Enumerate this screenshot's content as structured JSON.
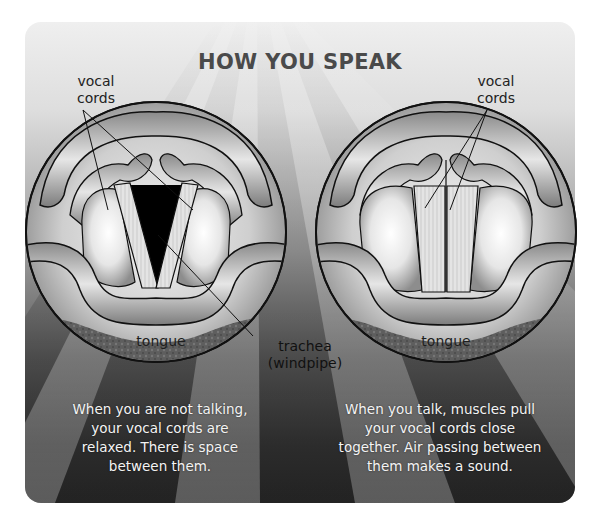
{
  "title": "HOW YOU SPEAK",
  "colors": {
    "panel_top": "#efefef",
    "panel_bottom": "#2e2e2e",
    "title": "#4a4a4a",
    "caption": "#f4f4f4",
    "opening": "#000000"
  },
  "left_figure": {
    "state": "not talking",
    "labels": {
      "vocal_cords": "vocal\ncords",
      "vocal_cords_line1": "vocal",
      "vocal_cords_line2": "cords",
      "tongue": "tongue",
      "trachea_line1": "trachea",
      "trachea_line2": "(windpipe)"
    },
    "caption_lines": [
      "When you are not talking,",
      "your vocal cords are",
      "relaxed.  There is space",
      "between them."
    ]
  },
  "right_figure": {
    "state": "talking",
    "labels": {
      "vocal_cords_line1": "vocal",
      "vocal_cords_line2": "cords",
      "tongue": "tongue"
    },
    "caption_lines": [
      "When you talk, muscles pull",
      "your vocal cords close",
      "together.  Air passing between",
      "them makes a sound."
    ]
  }
}
